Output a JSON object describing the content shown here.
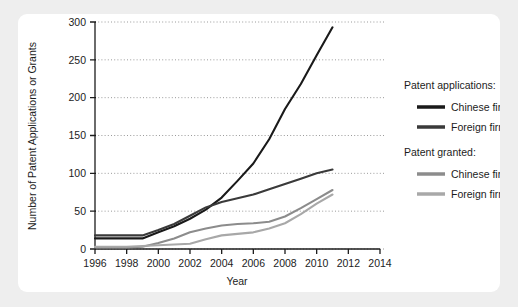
{
  "chart_data": {
    "type": "line",
    "title": "",
    "xlabel": "Year",
    "ylabel": "Number of Patent Applications or Grants",
    "xlim": [
      1996,
      2014
    ],
    "ylim": [
      0,
      300
    ],
    "xticks": [
      1996,
      1998,
      2000,
      2002,
      2004,
      2006,
      2008,
      2010,
      2012,
      2014
    ],
    "yticks": [
      0,
      50,
      100,
      150,
      200,
      250,
      300
    ],
    "grid": "horizontal-dotted",
    "legend_position": "right",
    "x": [
      1996,
      1997,
      1998,
      1999,
      2000,
      2001,
      2002,
      2003,
      2004,
      2005,
      2006,
      2007,
      2008,
      2009,
      2010,
      2011
    ],
    "series": [
      {
        "name": "Patent applications — Chinese firms",
        "group": "Patent applications:",
        "label": "Chinese firms",
        "color": "#1a1a1a",
        "values": [
          14,
          14,
          14,
          14,
          22,
          30,
          40,
          52,
          68,
          90,
          113,
          145,
          185,
          218,
          256,
          293
        ]
      },
      {
        "name": "Patent applications — Foreign firms",
        "group": "Patent applications:",
        "label": "Foreign firms",
        "color": "#3a3a3a",
        "values": [
          18,
          18,
          18,
          18,
          25,
          33,
          44,
          55,
          62,
          67,
          72,
          79,
          86,
          93,
          100,
          105
        ]
      },
      {
        "name": "Patent granted — Chinese firms",
        "group": "Patent granted:",
        "label": "Chinese firms",
        "color": "#8c8c8c",
        "values": [
          2,
          2,
          2,
          3,
          8,
          14,
          22,
          27,
          31,
          33,
          34,
          36,
          43,
          54,
          66,
          78
        ]
      },
      {
        "name": "Patent granted — Foreign firms",
        "group": "Patent granted:",
        "label": "Foreign firms",
        "color": "#a8a8a8",
        "values": [
          3,
          3,
          3,
          4,
          5,
          6,
          7,
          13,
          18,
          20,
          22,
          27,
          34,
          46,
          60,
          72
        ]
      }
    ],
    "legend": {
      "groups": [
        {
          "heading": "Patent applications:",
          "entries": [
            {
              "label": "Chinese firms",
              "color": "#1a1a1a"
            },
            {
              "label": "Foreign firms",
              "color": "#3a3a3a"
            }
          ]
        },
        {
          "heading": "Patent granted:",
          "entries": [
            {
              "label": "Chinese firms",
              "color": "#8c8c8c"
            },
            {
              "label": "Foreign firms",
              "color": "#a8a8a8"
            }
          ]
        }
      ]
    }
  },
  "axes": {
    "x_tick_labels": [
      "1996",
      "1998",
      "2000",
      "2002",
      "2004",
      "2006",
      "2008",
      "2010",
      "2012",
      "2014"
    ],
    "y_tick_labels": [
      "0",
      "50",
      "100",
      "150",
      "200",
      "250",
      "300"
    ],
    "x_title": "Year",
    "y_title": "Number of Patent Applications or Grants"
  },
  "legend_text": {
    "group1_heading": "Patent applications:",
    "group1_item1": "Chinese firms",
    "group1_item2": "Foreign firms",
    "group2_heading": "Patent granted:",
    "group2_item1": "Chinese firms",
    "group2_item2": "Foreign firms"
  },
  "colors": {
    "page_background": "#eeeeee",
    "card_background": "#ffffff",
    "axis": "#1c1c1c",
    "grid": "#9a9a9a",
    "applications_chinese": "#1a1a1a",
    "applications_foreign": "#3a3a3a",
    "granted_chinese": "#8c8c8c",
    "granted_foreign": "#a8a8a8"
  }
}
